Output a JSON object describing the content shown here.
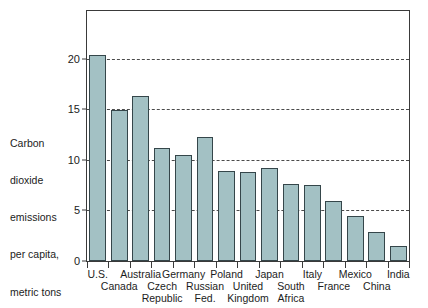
{
  "chart_data": {
    "type": "bar",
    "title": "",
    "xlabel": "",
    "ylabel": "Carbon dioxide emissions per capita, metric tons",
    "ylabel_lines": [
      "Carbon",
      "dioxide",
      "emissions",
      "per capita,",
      "metric tons"
    ],
    "categories": [
      "U.S.",
      "Canada",
      "Australia",
      "Czech Republic",
      "Germany",
      "Russian Fed.",
      "Poland",
      "United Kingdom",
      "Japan",
      "South Africa",
      "Italy",
      "France",
      "Mexico",
      "China",
      "India"
    ],
    "category_label_lines": [
      [
        "U.S."
      ],
      [
        "",
        "Canada"
      ],
      [
        "Australia"
      ],
      [
        "",
        "Czech",
        "Republic"
      ],
      [
        "Germany"
      ],
      [
        "",
        "Russian",
        "Fed."
      ],
      [
        "Poland"
      ],
      [
        "",
        "United",
        "Kingdom"
      ],
      [
        "Japan"
      ],
      [
        "",
        "South",
        "Africa"
      ],
      [
        "Italy"
      ],
      [
        "",
        "France"
      ],
      [
        "Mexico"
      ],
      [
        "",
        "China"
      ],
      [
        "India"
      ]
    ],
    "values": [
      20.4,
      14.9,
      16.3,
      11.2,
      10.5,
      12.3,
      8.9,
      8.8,
      9.2,
      7.6,
      7.5,
      5.9,
      4.4,
      2.9,
      1.5
    ],
    "ylim": [
      0,
      24.7
    ],
    "yticks": [
      0,
      5,
      10,
      15,
      20
    ],
    "ytick_labels": [
      "0",
      "5",
      "10",
      "15",
      "20"
    ],
    "grid": "horizontal-dashed",
    "legend": "none",
    "bar_fill_color": "#a3c1c4",
    "bar_edge_color": "#35464a",
    "frame_color": "#3a3a3a",
    "gridline_color": "#4a4a4a"
  }
}
